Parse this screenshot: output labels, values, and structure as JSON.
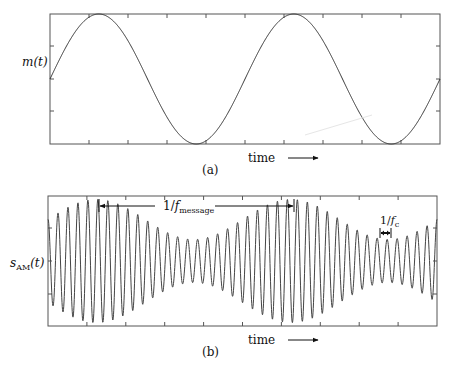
{
  "figure": {
    "panel_a": {
      "ylabel": "m(t)",
      "xlabel": "time",
      "caption": "(a)",
      "signal": "sinusoidal message signal",
      "cycles_shown": 2
    },
    "panel_b": {
      "ylabel_main": "s",
      "ylabel_sub": "AM",
      "ylabel_tail": "(t)",
      "xlabel": "time",
      "caption": "(b)",
      "annotation_message": {
        "prefix": "1/",
        "f": "f",
        "sub": "message"
      },
      "annotation_carrier": {
        "prefix": "1/",
        "f": "f",
        "sub": "c"
      },
      "signal": "amplitude-modulated carrier"
    },
    "colors": {
      "line": "#333333",
      "frame": "#555555",
      "text": "#111111"
    }
  },
  "chart_data": [
    {
      "type": "line",
      "title": "(a)",
      "xlabel": "time",
      "ylabel": "m(t)",
      "series": [
        {
          "name": "m(t)",
          "description": "sine wave, starts at zero, 2 full periods",
          "amplitude": 1,
          "periods": 2.0
        }
      ],
      "grid": false
    },
    {
      "type": "line",
      "title": "(b)",
      "xlabel": "time",
      "ylabel": "s_AM(t)",
      "series": [
        {
          "name": "s_AM(t)",
          "description": "carrier modulated by m(t), envelope min ~0.35, max ~1",
          "carrier_cycles": 39,
          "envelope_periods": 2.0
        }
      ],
      "annotations": [
        "1/f_message",
        "1/f_c"
      ],
      "grid": false
    }
  ]
}
